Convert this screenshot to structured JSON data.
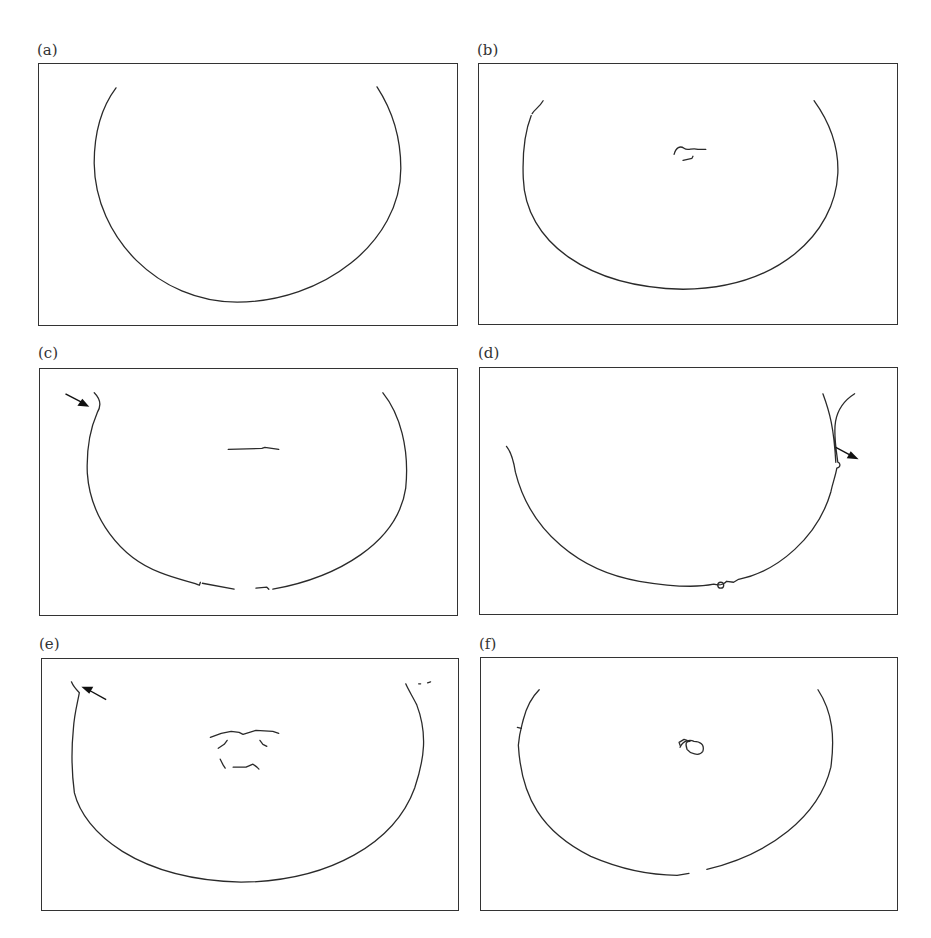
{
  "figure": {
    "panels": [
      {
        "id": "a",
        "label": "(a)",
        "description": "smooth semicircular contour",
        "has_arrow": false
      },
      {
        "id": "b",
        "label": "(b)",
        "description": "semicircular contour with small central fragments",
        "has_arrow": false
      },
      {
        "id": "c",
        "label": "(c)",
        "description": "jagged semicircular contour with central horizontal segment",
        "has_arrow": true,
        "arrow_direction": "down-right",
        "arrow_position": "upper-left"
      },
      {
        "id": "d",
        "label": "(d)",
        "description": "asymmetric jagged contour",
        "has_arrow": true,
        "arrow_direction": "down-right",
        "arrow_position": "right"
      },
      {
        "id": "e",
        "label": "(e)",
        "description": "noisy semicircular contour with central fragments",
        "has_arrow": true,
        "arrow_direction": "up-left",
        "arrow_position": "upper-left"
      },
      {
        "id": "f",
        "label": "(f)",
        "description": "semicircular contour with small central loop and bottom gap",
        "has_arrow": false
      }
    ]
  },
  "colors": {
    "line": "#2a2a2a",
    "frame": "#333333",
    "background": "#ffffff"
  }
}
